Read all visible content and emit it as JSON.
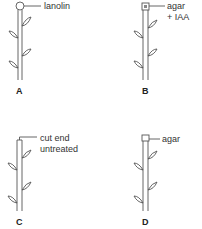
{
  "diagram": {
    "panels": [
      {
        "id": "A",
        "letter": "A",
        "tip": "lanolin ball",
        "label": "lanolin"
      },
      {
        "id": "B",
        "letter": "B",
        "tip": "agar block with IAA",
        "label_line1": "agar",
        "label_line2": "+ IAA"
      },
      {
        "id": "C",
        "letter": "C",
        "tip": "cut end",
        "label_line1": "cut end",
        "label_line2": "untreated"
      },
      {
        "id": "D",
        "letter": "D",
        "tip": "agar block",
        "label": "agar"
      }
    ],
    "colors": {
      "line": "#555555",
      "text": "#333333",
      "background": "#ffffff"
    }
  }
}
